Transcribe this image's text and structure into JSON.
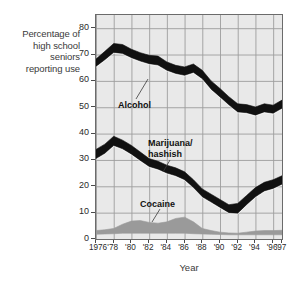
{
  "chart_data": {
    "type": "area",
    "title": "",
    "ylabel": "Percentage of high school seniors reporting use",
    "xlabel": "Year",
    "grid": true,
    "legend_position": "inline-labels",
    "ylim": [
      0,
      85
    ],
    "yticks": [
      0,
      10,
      20,
      30,
      40,
      50,
      60,
      70,
      80
    ],
    "x": [
      1976,
      1977,
      1978,
      1979,
      1980,
      1981,
      1982,
      1983,
      1984,
      1985,
      1986,
      1987,
      1988,
      1989,
      1990,
      1991,
      1992,
      1993,
      1994,
      1995,
      1996,
      1997
    ],
    "xtick_labels": [
      "1976",
      "'78",
      "'80",
      "'82",
      "'84",
      "'86",
      "'88",
      "'90",
      "'92",
      "'94",
      "'96",
      "'97"
    ],
    "xtick_values": [
      1976,
      1978,
      1980,
      1982,
      1984,
      1986,
      1988,
      1990,
      1992,
      1994,
      1996,
      1997
    ],
    "series": [
      {
        "name": "Alcohol",
        "color": "#111111",
        "band_upper": [
          68.3,
          71.2,
          74.2,
          73.8,
          72.0,
          70.7,
          69.7,
          69.4,
          67.2,
          65.9,
          65.3,
          66.4,
          64.0,
          60.0,
          57.1,
          54.0,
          51.3,
          51.0,
          50.1,
          51.3,
          50.8,
          52.7
        ],
        "band_lower": [
          65.5,
          68.0,
          70.8,
          70.4,
          68.8,
          67.5,
          66.5,
          66.0,
          64.0,
          62.8,
          62.1,
          63.2,
          60.8,
          56.8,
          53.9,
          50.9,
          48.2,
          47.9,
          47.0,
          48.2,
          47.7,
          49.6
        ]
      },
      {
        "name": "Marijuana/hashish",
        "color": "#111111",
        "band_upper": [
          34.0,
          36.0,
          39.0,
          37.5,
          35.5,
          33.0,
          30.5,
          29.5,
          28.0,
          27.0,
          25.5,
          22.5,
          19.0,
          17.0,
          15.0,
          13.0,
          13.5,
          16.5,
          19.5,
          21.5,
          22.5,
          24.0
        ],
        "band_lower": [
          30.5,
          32.5,
          35.5,
          34.2,
          32.2,
          29.8,
          27.5,
          26.5,
          25.0,
          24.0,
          22.5,
          19.5,
          16.0,
          14.0,
          12.0,
          10.0,
          9.8,
          13.0,
          16.0,
          18.2,
          19.2,
          20.8
        ]
      },
      {
        "name": "Cocaine",
        "color": "#9a9a9a",
        "band_upper": [
          3.2,
          3.5,
          4.0,
          5.6,
          6.8,
          7.0,
          6.3,
          6.0,
          6.5,
          7.8,
          8.3,
          6.5,
          4.0,
          3.2,
          2.6,
          2.3,
          2.2,
          2.6,
          3.0,
          3.2,
          3.2,
          3.3
        ],
        "band_lower": [
          1.8,
          1.9,
          2.0,
          2.2,
          2.2,
          2.2,
          2.2,
          2.2,
          2.2,
          2.2,
          2.2,
          2.0,
          1.9,
          1.8,
          1.7,
          1.6,
          1.6,
          1.6,
          1.6,
          1.6,
          1.6,
          1.6
        ]
      }
    ],
    "annotations": [
      {
        "label": "Alcohol",
        "x": 1980,
        "y": 57
      },
      {
        "label_line1": "Marijuana/",
        "label_line2": "hashish",
        "x": 1985,
        "y": 42
      },
      {
        "label": "Cocaine",
        "x": 1984,
        "y": 18
      }
    ]
  },
  "axes": {
    "y_caption_lines": [
      "Percentage of",
      "high school",
      "seniors",
      "reporting use"
    ],
    "x_title": "Year"
  },
  "labels": {
    "alcohol": "Alcohol",
    "marijuana_line1": "Marijuana/",
    "marijuana_line2": "hashish",
    "cocaine": "Cocaine"
  },
  "colors": {
    "plot_background": "#e9e9e9",
    "grid": "#9d9d9d",
    "frame": "#6b6b6b",
    "alcohol": "#111111",
    "marijuana": "#111111",
    "cocaine": "#9a9a9a",
    "text": "#2a2a2a"
  }
}
